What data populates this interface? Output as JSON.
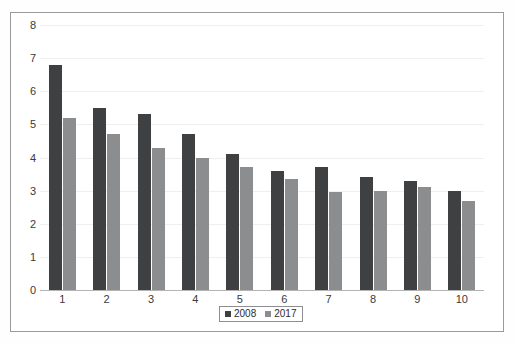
{
  "chart_data": {
    "type": "bar",
    "title": "",
    "subtitle": "",
    "xlabel": "",
    "ylabel": "",
    "categories": [
      "1",
      "2",
      "3",
      "4",
      "5",
      "6",
      "7",
      "8",
      "9",
      "10"
    ],
    "series": [
      {
        "name": "2008",
        "color": "#3f4042",
        "values": [
          6.8,
          5.5,
          5.3,
          4.7,
          4.1,
          3.6,
          3.7,
          3.4,
          3.3,
          3.0
        ]
      },
      {
        "name": "2017",
        "color": "#8c8d8f",
        "values": [
          5.2,
          4.7,
          4.3,
          4.0,
          3.7,
          3.35,
          2.95,
          3.0,
          3.1,
          2.7
        ]
      }
    ],
    "ylim": [
      0,
      8
    ],
    "ytick_labels": [
      "0",
      "1",
      "2",
      "3",
      "4",
      "5",
      "6",
      "7",
      "8"
    ],
    "ytick_values": [
      0,
      1,
      2,
      3,
      4,
      5,
      6,
      7,
      8
    ],
    "grid": true,
    "grid_axis": "y",
    "legend_position": "bottom-center",
    "legend_entries": [
      "2008",
      "2017"
    ]
  },
  "colors": {
    "series_2008": "#3f4042",
    "series_2017": "#8c8d8f",
    "gridline": "#efefef",
    "axis": "#b4b4b4",
    "frame_border": "#9a9a9a",
    "background": "#ffffff",
    "tick_text": "#3a3a3a"
  }
}
